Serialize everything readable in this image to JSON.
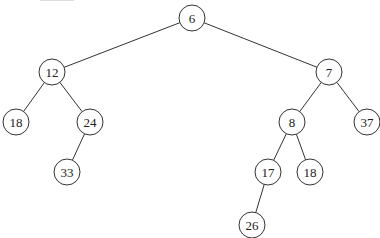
{
  "diagram": {
    "type": "binary-tree",
    "width": 380,
    "height": 238,
    "node_radius": 13,
    "colors": {
      "stroke": "#333333",
      "fill": "#ffffff",
      "text": "#222222",
      "background": "#ffffff"
    },
    "nodes": [
      {
        "id": "n6",
        "label": "6",
        "x": 192,
        "y": 18
      },
      {
        "id": "n12",
        "label": "12",
        "x": 52,
        "y": 72
      },
      {
        "id": "n7",
        "label": "7",
        "x": 329,
        "y": 72
      },
      {
        "id": "n18a",
        "label": "18",
        "x": 16,
        "y": 122
      },
      {
        "id": "n24",
        "label": "24",
        "x": 90,
        "y": 122
      },
      {
        "id": "n33",
        "label": "33",
        "x": 67,
        "y": 172
      },
      {
        "id": "n8",
        "label": "8",
        "x": 292,
        "y": 122
      },
      {
        "id": "n37",
        "label": "37",
        "x": 367,
        "y": 122
      },
      {
        "id": "n17",
        "label": "17",
        "x": 268,
        "y": 172
      },
      {
        "id": "n18b",
        "label": "18",
        "x": 310,
        "y": 172
      },
      {
        "id": "n26",
        "label": "26",
        "x": 252,
        "y": 225
      }
    ],
    "edges": [
      {
        "from": "n6",
        "to": "n12"
      },
      {
        "from": "n6",
        "to": "n7"
      },
      {
        "from": "n12",
        "to": "n18a"
      },
      {
        "from": "n12",
        "to": "n24"
      },
      {
        "from": "n24",
        "to": "n33"
      },
      {
        "from": "n7",
        "to": "n8"
      },
      {
        "from": "n7",
        "to": "n37"
      },
      {
        "from": "n8",
        "to": "n17"
      },
      {
        "from": "n8",
        "to": "n18b"
      },
      {
        "from": "n17",
        "to": "n26"
      }
    ]
  }
}
